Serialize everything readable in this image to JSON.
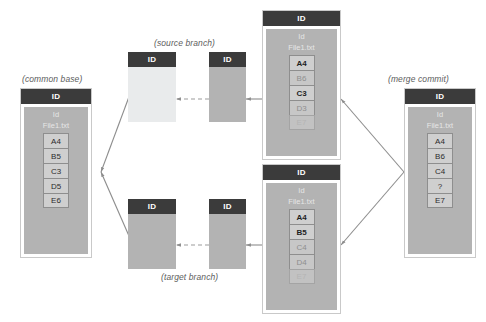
{
  "diagram": {
    "title_captions": {
      "common_base": "(common base)",
      "source_branch": "(source branch)",
      "target_branch": "(target branch)",
      "merge_commit": "(merge commit)"
    },
    "labels": {
      "id_header": "ID",
      "panel_id": "Id",
      "file_name": "File1.txt"
    },
    "commits": [
      {
        "key": "common_base",
        "caption": "(common base)",
        "header": "ID",
        "panel_id": "Id",
        "file": "File1.txt",
        "rows": [
          {
            "text": "A4",
            "state": "normal"
          },
          {
            "text": "B5",
            "state": "normal"
          },
          {
            "text": "C3",
            "state": "normal"
          },
          {
            "text": "D5",
            "state": "normal"
          },
          {
            "text": "E6",
            "state": "normal"
          }
        ]
      },
      {
        "key": "source_tip",
        "caption": "(source branch)",
        "header": "ID",
        "panel_id": "Id",
        "file": "File1.txt",
        "rows": [
          {
            "text": "A4",
            "state": "strong"
          },
          {
            "text": "B6",
            "state": "dim"
          },
          {
            "text": "C3",
            "state": "strong"
          },
          {
            "text": "D3",
            "state": "dim"
          },
          {
            "text": "E7",
            "state": "faint"
          }
        ]
      },
      {
        "key": "target_tip",
        "caption": "(target branch)",
        "header": "ID",
        "panel_id": "Id",
        "file": "File1.txt",
        "rows": [
          {
            "text": "A4",
            "state": "strong"
          },
          {
            "text": "B5",
            "state": "strong"
          },
          {
            "text": "C4",
            "state": "dim"
          },
          {
            "text": "D4",
            "state": "dim"
          },
          {
            "text": "E7",
            "state": "faint"
          }
        ]
      },
      {
        "key": "merge_commit",
        "caption": "(merge commit)",
        "header": "ID",
        "panel_id": "Id",
        "file": "File1.txt",
        "rows": [
          {
            "text": "A4",
            "state": "normal"
          },
          {
            "text": "B6",
            "state": "normal"
          },
          {
            "text": "C4",
            "state": "normal"
          },
          {
            "text": "?",
            "state": "normal"
          },
          {
            "text": "E7",
            "state": "normal"
          }
        ]
      }
    ],
    "branch_nodes": [
      {
        "key": "source_node_1",
        "header": "ID",
        "fill": "pale"
      },
      {
        "key": "source_node_2",
        "header": "ID",
        "fill": "grey"
      },
      {
        "key": "target_node_1",
        "header": "ID",
        "fill": "grey"
      },
      {
        "key": "target_node_2",
        "header": "ID",
        "fill": "grey"
      }
    ],
    "colors": {
      "header": "#3b3b3b",
      "panel": "#b3b3b3",
      "cell": "#cfcfcf",
      "pale_node": "#e9ebec",
      "connector": "#8d8d8d",
      "caption": "#5d5d5d",
      "background": "#ffffff"
    }
  }
}
